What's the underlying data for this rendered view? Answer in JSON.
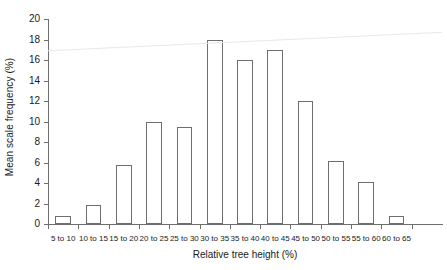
{
  "chart_data": {
    "type": "bar",
    "title": "",
    "xlabel": "Relative tree height (%)",
    "ylabel": "Mean scale frequency (%)",
    "categories": [
      "5 to 10",
      "10 to 15",
      "15 to 20",
      "20 to 25",
      "25 to 30",
      "30 to 35",
      "35 to 40",
      "40 to 45",
      "45 to 50",
      "50 to 55",
      "55 to 60",
      "60 to 65"
    ],
    "values": [
      0.8,
      1.9,
      5.8,
      10.0,
      9.5,
      18.0,
      16.0,
      17.0,
      12.0,
      6.1,
      4.1,
      0.8
    ],
    "ylim": [
      0,
      20
    ],
    "yticks": [
      0,
      2,
      4,
      6,
      8,
      10,
      12,
      14,
      16,
      18,
      20
    ],
    "ytick_labels": [
      "0",
      "2",
      "4",
      "6",
      "8",
      "10",
      "12",
      "14",
      "16",
      "18",
      "20"
    ],
    "grid": false,
    "legend": "none",
    "bar_face_color": "#ffffff",
    "bar_edge_color": "#6e6e6e",
    "axis_color": "#6e6e6e",
    "annotations": [
      {
        "name": "trend-line",
        "type": "line",
        "color": "#e8e8e8",
        "x_start_frac": 0.0,
        "x_end_frac": 1.0,
        "y_start": 16.9,
        "y_end": 18.7
      }
    ]
  }
}
